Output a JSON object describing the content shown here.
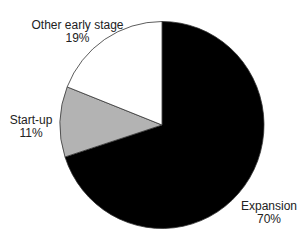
{
  "chart_data": {
    "type": "pie",
    "title": "",
    "categories": [
      "Expansion",
      "Start-up",
      "Other early stage"
    ],
    "values": [
      70,
      11,
      19
    ],
    "labels": [
      "70%",
      "11%",
      "19%"
    ],
    "colors": [
      "#000000",
      "#b3b3b3",
      "#ffffff"
    ],
    "start_angle": "12 o'clock, clockwise",
    "legend": "none (direct labels)"
  },
  "labels": {
    "expansion": {
      "name": "Expansion",
      "pct": "70%"
    },
    "startup": {
      "name": "Start-up",
      "pct": "11%"
    },
    "other": {
      "name": "Other early stage",
      "pct": "19%"
    }
  }
}
